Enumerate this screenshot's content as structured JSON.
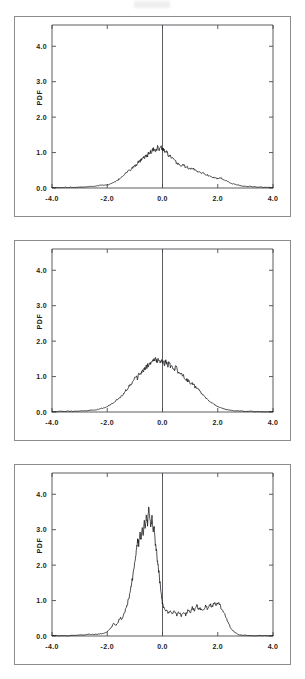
{
  "figure": {
    "panel_count": 3,
    "background": "#ffffff",
    "line_color": "#141417",
    "axis_color": "#4a4a50",
    "frame_color": "#8b8b90"
  },
  "chart_data": [
    {
      "type": "line",
      "title": "",
      "xlabel": "",
      "ylabel": "PDF",
      "xlim": [
        -4.0,
        4.0
      ],
      "ylim": [
        0.0,
        4.6
      ],
      "xticks": [
        -4.0,
        -2.0,
        0.0,
        2.0,
        4.0
      ],
      "xticklabels": [
        "-4.0",
        "-2.0",
        "0.0",
        "2.0",
        "4.0"
      ],
      "yticks": [
        0.0,
        1.0,
        2.0,
        3.0,
        4.0
      ],
      "yticklabels": [
        "0.0",
        "1.0",
        "2.0",
        "3.0",
        "4.0"
      ],
      "grid": false,
      "legend": null,
      "vertical_reference_line": 0.0,
      "x": [
        -4.0,
        -3.85,
        -3.7,
        -3.55,
        -3.4,
        -3.25,
        -3.1,
        -2.95,
        -2.8,
        -2.65,
        -2.5,
        -2.4,
        -2.3,
        -2.2,
        -2.1,
        -2.0,
        -1.9,
        -1.8,
        -1.7,
        -1.62,
        -1.54,
        -1.46,
        -1.38,
        -1.3,
        -1.22,
        -1.14,
        -1.06,
        -0.98,
        -0.9,
        -0.84,
        -0.78,
        -0.72,
        -0.66,
        -0.6,
        -0.54,
        -0.48,
        -0.42,
        -0.36,
        -0.3,
        -0.24,
        -0.18,
        -0.12,
        -0.06,
        0.0,
        0.06,
        0.12,
        0.18,
        0.26,
        0.34,
        0.42,
        0.5,
        0.58,
        0.66,
        0.74,
        0.82,
        0.9,
        1.0,
        1.1,
        1.2,
        1.3,
        1.4,
        1.5,
        1.6,
        1.7,
        1.8,
        1.9,
        2.0,
        2.1,
        2.2,
        2.35,
        2.5,
        2.65,
        2.8,
        3.0,
        3.2,
        3.4,
        3.6,
        3.8,
        4.0
      ],
      "y": [
        0.01,
        0.01,
        0.01,
        0.02,
        0.02,
        0.02,
        0.02,
        0.03,
        0.03,
        0.04,
        0.05,
        0.06,
        0.07,
        0.08,
        0.08,
        0.09,
        0.11,
        0.14,
        0.18,
        0.22,
        0.27,
        0.33,
        0.38,
        0.44,
        0.48,
        0.53,
        0.59,
        0.63,
        0.7,
        0.74,
        0.77,
        0.82,
        0.86,
        0.9,
        0.93,
        0.98,
        1.02,
        1.06,
        1.11,
        1.06,
        1.15,
        1.08,
        1.16,
        1.09,
        1.06,
        1.02,
        0.97,
        0.9,
        0.83,
        0.78,
        0.72,
        0.68,
        0.63,
        0.65,
        0.61,
        0.58,
        0.53,
        0.55,
        0.5,
        0.47,
        0.44,
        0.41,
        0.37,
        0.35,
        0.31,
        0.28,
        0.26,
        0.29,
        0.24,
        0.18,
        0.13,
        0.1,
        0.07,
        0.05,
        0.04,
        0.03,
        0.02,
        0.02,
        0.01
      ]
    },
    {
      "type": "line",
      "title": "",
      "xlabel": "",
      "ylabel": "PDF",
      "xlim": [
        -4.0,
        4.0
      ],
      "ylim": [
        0.0,
        4.6
      ],
      "xticks": [
        -4.0,
        -2.0,
        0.0,
        2.0,
        4.0
      ],
      "xticklabels": [
        "-4.0",
        "-2.0",
        "0.0",
        "2.0",
        "4.0"
      ],
      "yticks": [
        0.0,
        1.0,
        2.0,
        3.0,
        4.0
      ],
      "yticklabels": [
        "0.0",
        "1.0",
        "2.0",
        "3.0",
        "4.0"
      ],
      "grid": false,
      "legend": null,
      "vertical_reference_line": 0.0,
      "x": [
        -4.0,
        -3.8,
        -3.6,
        -3.4,
        -3.2,
        -3.0,
        -2.85,
        -2.7,
        -2.55,
        -2.45,
        -2.35,
        -2.25,
        -2.15,
        -2.05,
        -1.95,
        -1.85,
        -1.75,
        -1.65,
        -1.55,
        -1.47,
        -1.39,
        -1.31,
        -1.23,
        -1.15,
        -1.07,
        -0.99,
        -0.91,
        -0.85,
        -0.79,
        -0.73,
        -0.67,
        -0.61,
        -0.55,
        -0.49,
        -0.43,
        -0.37,
        -0.31,
        -0.25,
        -0.19,
        -0.13,
        -0.07,
        0.0,
        0.06,
        0.12,
        0.18,
        0.24,
        0.3,
        0.36,
        0.42,
        0.48,
        0.56,
        0.64,
        0.72,
        0.8,
        0.88,
        0.96,
        1.05,
        1.15,
        1.25,
        1.35,
        1.45,
        1.55,
        1.65,
        1.75,
        1.85,
        1.95,
        2.05,
        2.15,
        2.3,
        2.45,
        2.6,
        2.8,
        3.0,
        3.2,
        3.4,
        3.6,
        3.8,
        4.0
      ],
      "y": [
        0.01,
        0.01,
        0.02,
        0.02,
        0.02,
        0.03,
        0.03,
        0.04,
        0.05,
        0.06,
        0.07,
        0.09,
        0.11,
        0.14,
        0.18,
        0.23,
        0.28,
        0.34,
        0.4,
        0.47,
        0.54,
        0.62,
        0.7,
        0.78,
        0.86,
        1.02,
        0.95,
        1.1,
        1.04,
        1.14,
        1.18,
        1.24,
        1.3,
        1.36,
        1.41,
        1.44,
        1.47,
        1.5,
        1.44,
        1.47,
        1.41,
        1.43,
        1.36,
        1.4,
        1.32,
        1.36,
        1.26,
        1.31,
        1.22,
        1.25,
        1.16,
        1.1,
        1.04,
        0.98,
        0.92,
        0.85,
        0.8,
        0.74,
        0.66,
        0.58,
        0.5,
        0.42,
        0.35,
        0.28,
        0.22,
        0.17,
        0.13,
        0.1,
        0.07,
        0.05,
        0.04,
        0.03,
        0.02,
        0.02,
        0.01,
        0.01,
        0.01,
        0.01
      ]
    },
    {
      "type": "line",
      "title": "",
      "xlabel": "",
      "ylabel": "PDF",
      "xlim": [
        -4.0,
        4.0
      ],
      "ylim": [
        0.0,
        4.6
      ],
      "xticks": [
        -4.0,
        -2.0,
        0.0,
        2.0,
        4.0
      ],
      "xticklabels": [
        "-4.0",
        "-2.0",
        "0.0",
        "2.0",
        "4.0"
      ],
      "yticks": [
        0.0,
        1.0,
        2.0,
        3.0,
        4.0
      ],
      "yticklabels": [
        "0.0",
        "1.0",
        "2.0",
        "3.0",
        "4.0"
      ],
      "grid": false,
      "legend": null,
      "vertical_reference_line": 0.0,
      "x": [
        -4.0,
        -3.7,
        -3.4,
        -3.1,
        -2.8,
        -2.6,
        -2.45,
        -2.3,
        -2.2,
        -2.1,
        -2.0,
        -1.92,
        -1.84,
        -1.76,
        -1.68,
        -1.6,
        -1.52,
        -1.46,
        -1.4,
        -1.34,
        -1.28,
        -1.22,
        -1.16,
        -1.1,
        -1.04,
        -0.98,
        -0.94,
        -0.9,
        -0.86,
        -0.82,
        -0.78,
        -0.74,
        -0.7,
        -0.66,
        -0.62,
        -0.58,
        -0.54,
        -0.5,
        -0.46,
        -0.42,
        -0.38,
        -0.34,
        -0.3,
        -0.26,
        -0.22,
        -0.18,
        -0.14,
        -0.1,
        -0.06,
        -0.02,
        0.0,
        0.05,
        0.12,
        0.2,
        0.28,
        0.36,
        0.44,
        0.52,
        0.6,
        0.68,
        0.76,
        0.84,
        0.92,
        1.0,
        1.08,
        1.16,
        1.24,
        1.32,
        1.4,
        1.48,
        1.56,
        1.64,
        1.72,
        1.8,
        1.88,
        1.96,
        2.04,
        2.12,
        2.2,
        2.3,
        2.4,
        2.5,
        2.65,
        2.8,
        3.0,
        3.3,
        3.6,
        4.0
      ],
      "y": [
        0.01,
        0.01,
        0.01,
        0.02,
        0.04,
        0.05,
        0.04,
        0.06,
        0.06,
        0.08,
        0.12,
        0.18,
        0.26,
        0.36,
        0.3,
        0.42,
        0.52,
        0.46,
        0.6,
        0.74,
        0.88,
        1.05,
        1.28,
        1.55,
        1.85,
        2.2,
        2.45,
        2.75,
        2.55,
        2.95,
        2.7,
        3.05,
        2.85,
        3.25,
        3.05,
        3.45,
        3.15,
        3.62,
        3.3,
        3.05,
        3.38,
        2.9,
        3.1,
        2.6,
        2.4,
        2.1,
        1.85,
        1.55,
        1.3,
        1.05,
        0.92,
        0.78,
        0.74,
        0.68,
        0.72,
        0.62,
        0.7,
        0.6,
        0.66,
        0.58,
        0.64,
        0.6,
        0.72,
        0.66,
        0.8,
        0.72,
        0.86,
        0.74,
        0.78,
        0.7,
        0.84,
        0.76,
        0.9,
        0.82,
        0.96,
        0.88,
        0.92,
        0.8,
        0.7,
        0.52,
        0.34,
        0.18,
        0.08,
        0.03,
        0.02,
        0.01,
        0.01,
        0.01
      ]
    }
  ]
}
